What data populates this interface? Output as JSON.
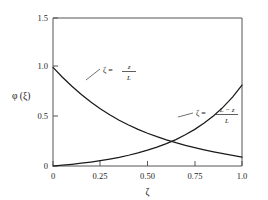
{
  "chart_data": {
    "type": "line",
    "title": "",
    "xlabel": "ζ",
    "ylabel": "φ (ξ)",
    "xlim": [
      0,
      1.0
    ],
    "ylim": [
      0,
      1.5
    ],
    "grid": false,
    "legend_position": "inline-annotations",
    "x_tick_labels": [
      "0",
      "0.25",
      "0.50",
      "0.75",
      "1.0"
    ],
    "x_tick_values": [
      0,
      0.25,
      0.5,
      0.75,
      1.0
    ],
    "y_tick_labels": [
      "0",
      "0.5",
      "1.0",
      "1.5"
    ],
    "y_tick_values": [
      0,
      0.5,
      1.0,
      1.5
    ],
    "x": [
      0,
      0.05,
      0.1,
      0.15,
      0.2,
      0.25,
      0.3,
      0.35,
      0.4,
      0.45,
      0.5,
      0.55,
      0.6,
      0.65,
      0.7,
      0.75,
      0.8,
      0.85,
      0.9,
      0.95,
      1.0
    ],
    "series": [
      {
        "name": "decaying",
        "annotation": "ζ = z / L",
        "annotation_numerator": "z",
        "annotation_denominator": "L",
        "annotation_lhs": "ζ =",
        "values": [
          1.0,
          0.9,
          0.808,
          0.724,
          0.648,
          0.58,
          0.519,
          0.464,
          0.415,
          0.371,
          0.332,
          0.297,
          0.265,
          0.236,
          0.21,
          0.186,
          0.164,
          0.144,
          0.125,
          0.107,
          0.09
        ]
      },
      {
        "name": "rising",
        "annotation": "ζ = (L − z) / L",
        "annotation_numerator": "L − z",
        "annotation_denominator": "L",
        "annotation_lhs": "ζ =",
        "values": [
          0.0,
          0.008,
          0.017,
          0.028,
          0.04,
          0.054,
          0.07,
          0.088,
          0.109,
          0.133,
          0.16,
          0.191,
          0.227,
          0.268,
          0.316,
          0.371,
          0.435,
          0.51,
          0.597,
          0.698,
          0.82
        ]
      }
    ],
    "crossing_point": {
      "x": 0.5,
      "y": 0.35
    }
  },
  "axes": {
    "y_label": "φ (ξ)",
    "x_label": "ζ",
    "y_ticks": [
      {
        "label": "1.5",
        "value": 1.5
      },
      {
        "label": "1.0",
        "value": 1.0
      },
      {
        "label": "0.5",
        "value": 0.5
      },
      {
        "label": "0",
        "value": 0
      }
    ],
    "x_ticks": [
      {
        "label": "0",
        "value": 0
      },
      {
        "label": "0.25",
        "value": 0.25
      },
      {
        "label": "0.50",
        "value": 0.5
      },
      {
        "label": "0.75",
        "value": 0.75
      },
      {
        "label": "1.0",
        "value": 1.0
      }
    ]
  },
  "annotations": {
    "upper": {
      "lhs": "ζ =",
      "numerator": "z",
      "denominator": "L"
    },
    "lower": {
      "lhs": "ζ =",
      "numerator": "L − z",
      "denominator": "L"
    }
  },
  "colors": {
    "background": "#ffffff",
    "curve": "#1a1a1a",
    "frame": "#555555",
    "text": "#1a1a1a"
  }
}
